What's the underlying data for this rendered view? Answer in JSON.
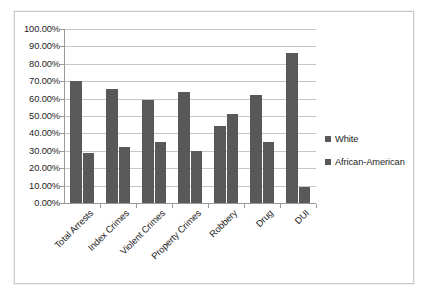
{
  "chart_data": {
    "type": "bar",
    "title": "",
    "xlabel": "",
    "ylabel": "",
    "ylim": [
      0,
      1.0
    ],
    "grid": true,
    "legend_position": "right",
    "categories": [
      "Total Arrests",
      "Index Crimes",
      "Violent Crimes",
      "Property Crimes",
      "Robbery",
      "Drug",
      "DUI"
    ],
    "y_tick_labels": [
      "100.00%",
      "90.00%",
      "80.00%",
      "70.00%",
      "60.00%",
      "50.00%",
      "40.00%",
      "30.00%",
      "20.00%",
      "10.00%",
      "0.00%"
    ],
    "y_tick_values": [
      100,
      90,
      80,
      70,
      60,
      50,
      40,
      30,
      20,
      10,
      0
    ],
    "series": [
      {
        "name": "White",
        "color": "#595959",
        "values": [
          70.0,
          65.5,
          59.0,
          64.0,
          44.0,
          62.0,
          86.5
        ]
      },
      {
        "name": "African-American",
        "color": "#595959",
        "values": [
          28.5,
          32.0,
          35.0,
          30.0,
          51.0,
          35.0,
          9.0
        ]
      }
    ]
  },
  "legend": {
    "items": [
      {
        "label": "White"
      },
      {
        "label": "African-American"
      }
    ]
  }
}
